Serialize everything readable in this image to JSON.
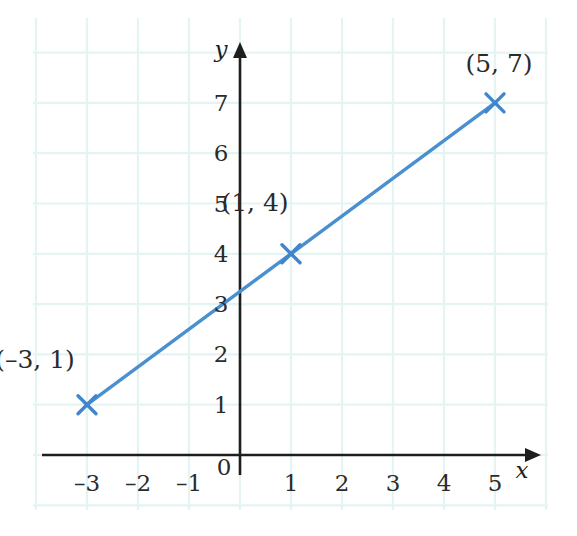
{
  "chart_data": {
    "type": "line",
    "title": "",
    "subtitle": "",
    "xlabel": "x",
    "ylabel": "y",
    "xlim": [
      -3.9,
      5.8
    ],
    "ylim": [
      -0.8,
      7.8
    ],
    "xticks": [
      -3,
      -2,
      -1,
      0,
      1,
      2,
      3,
      4,
      5
    ],
    "yticks": [
      0,
      1,
      2,
      3,
      4,
      5,
      6,
      7
    ],
    "xtick_labels": [
      "–3",
      "–2",
      "–1",
      "0",
      "1",
      "2",
      "3",
      "4",
      "5"
    ],
    "ytick_labels": [
      "0",
      "1",
      "2",
      "3",
      "4",
      "5",
      "6",
      "7"
    ],
    "grid": true,
    "legend": "none",
    "equation": "y = 0.75x + 3.25",
    "y_intercept": 3.25,
    "slope": 0.75,
    "series": [
      {
        "name": "line",
        "color": "#4a8fd0",
        "marker": "x",
        "x": [
          -3,
          1,
          5
        ],
        "y": [
          1,
          4,
          7
        ],
        "points": [
          {
            "x": -3,
            "y": 1,
            "label": "(–3, 1)",
            "label_dx": -52,
            "label_dy": -46
          },
          {
            "x": 1,
            "y": 4,
            "label": "(1, 4)",
            "label_dx": -36,
            "label_dy": -52
          },
          {
            "x": 5,
            "y": 7,
            "label": "(5, 7)",
            "label_dx": 4,
            "label_dy": -40
          }
        ]
      }
    ],
    "annotations": [
      {
        "text": "(–3, 1)",
        "x": -3,
        "y": 1
      },
      {
        "text": "(1, 4)",
        "x": 1,
        "y": 4
      },
      {
        "text": "(5, 7)",
        "x": 5,
        "y": 7
      }
    ]
  },
  "colors": {
    "line": "#4a8fd0",
    "marker": "#3f86cc",
    "axis": "#1e1e1e",
    "grid": "#e3f4f3",
    "background": "#ffffff",
    "text": "#2b2b2b"
  },
  "geometry": {
    "origin_x": 240,
    "origin_y": 455,
    "unit_x": 51,
    "unit_y": 50.3,
    "grid_left": 33,
    "grid_top": 18,
    "grid_right": 548,
    "grid_bottom": 510,
    "x_axis_left": 42,
    "x_axis_right": 541,
    "y_axis_top": 42
  }
}
